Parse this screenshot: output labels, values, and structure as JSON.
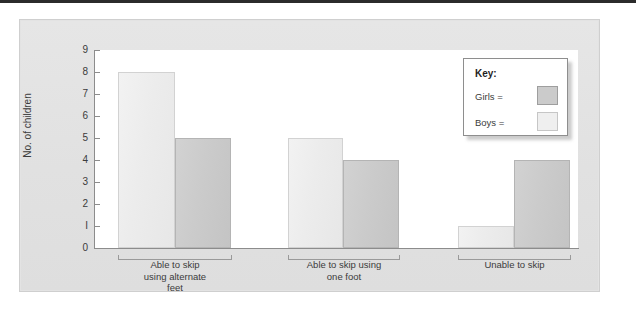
{
  "chart_data": {
    "type": "bar",
    "title": "",
    "xlabel": "",
    "ylabel": "No. of children",
    "ylim": [
      0,
      9
    ],
    "yticks": [
      "0",
      "1",
      "2",
      "3",
      "4",
      "5",
      "6",
      "7",
      "8",
      "9"
    ],
    "grid": false,
    "legend_position": "top-right",
    "categories": [
      "Able to skip using alternate feet",
      "Able to skip using one foot",
      "Unable to skip"
    ],
    "category_lines": [
      [
        "Able to skip",
        "using alternate",
        "feet"
      ],
      [
        "Able to skip using",
        "one foot"
      ],
      [
        "Unable to skip"
      ]
    ],
    "series": [
      {
        "name": "Boys",
        "values": [
          8,
          5,
          1
        ],
        "color": "#ededed"
      },
      {
        "name": "Girls",
        "values": [
          5,
          4,
          4
        ],
        "color": "#cbcbcb"
      }
    ]
  },
  "legend": {
    "title": "Key:",
    "entries": [
      {
        "label": "Girls =",
        "swatch": "girls"
      },
      {
        "label": "Boys =",
        "swatch": "boys"
      }
    ]
  }
}
